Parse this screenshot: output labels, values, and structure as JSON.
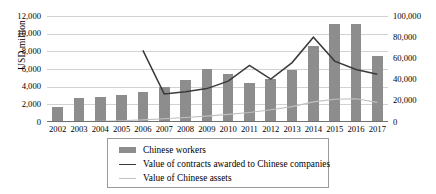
{
  "chart_data": {
    "type": "bar",
    "title": "",
    "xlabel": "",
    "ylabel": "USD million",
    "y2label": "",
    "grid": true,
    "legend_position": "bottom",
    "categories": [
      "2002",
      "2003",
      "2004",
      "2005",
      "2006",
      "2007",
      "2008",
      "2009",
      "2010",
      "2011",
      "2012",
      "2013",
      "2014",
      "2015",
      "2016",
      "2017"
    ],
    "ylim": [
      0,
      12000
    ],
    "y_ticks": [
      "0",
      "2,000",
      "4,000",
      "6,000",
      "8,000",
      "10,000",
      "12,000"
    ],
    "y_tick_values": [
      0,
      2000,
      4000,
      6000,
      8000,
      10000,
      12000
    ],
    "y2lim": [
      0,
      100000
    ],
    "y2_ticks": [
      "0",
      "20,000",
      "40,000",
      "60,000",
      "80,000",
      "100,000"
    ],
    "y2_tick_values": [
      0,
      20000,
      40000,
      60000,
      80000,
      100000
    ],
    "series": [
      {
        "name": "Chinese workers",
        "type": "bar",
        "axis": "left",
        "color": "#8d8d8d",
        "values": [
          1700,
          2700,
          2800,
          3050,
          3450,
          3950,
          4750,
          6000,
          5400,
          4400,
          4900,
          5850,
          8550,
          11050,
          11100,
          7450
        ]
      },
      {
        "name": "Value of contracts awarded to Chinese companies",
        "type": "line",
        "axis": "right",
        "color": "#3a3a3a",
        "values": [
          null,
          null,
          null,
          null,
          67500,
          26500,
          28500,
          31500,
          38500,
          53500,
          40500,
          56000,
          80000,
          57500,
          49500,
          45000
        ]
      },
      {
        "name": "Value of Chinese assets",
        "type": "line",
        "axis": "right",
        "color": "#c0c0c0",
        "values": [
          300,
          500,
          700,
          1200,
          2000,
          3000,
          4200,
          5600,
          7200,
          9000,
          11500,
          14500,
          19000,
          21500,
          22000,
          18500
        ]
      }
    ]
  },
  "legend": {
    "items": [
      {
        "label": "Chinese workers",
        "marker": "bar-swatch"
      },
      {
        "label": "Value of contracts awarded to Chinese companies",
        "marker": "dark-line-swatch"
      },
      {
        "label": "Value of Chinese assets",
        "marker": "light-line-swatch"
      }
    ]
  }
}
